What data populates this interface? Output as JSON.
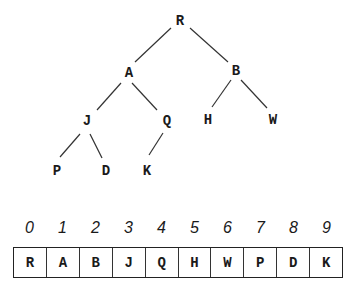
{
  "tree": {
    "nodes": [
      {
        "id": "R",
        "label": "R",
        "x": 180,
        "y": 21
      },
      {
        "id": "A",
        "label": "A",
        "x": 129,
        "y": 73
      },
      {
        "id": "B",
        "label": "B",
        "x": 236,
        "y": 71
      },
      {
        "id": "J",
        "label": "J",
        "x": 87,
        "y": 121
      },
      {
        "id": "Q",
        "label": "Q",
        "x": 167,
        "y": 121
      },
      {
        "id": "H",
        "label": "H",
        "x": 208,
        "y": 120
      },
      {
        "id": "W",
        "label": "W",
        "x": 273,
        "y": 120
      },
      {
        "id": "P",
        "label": "P",
        "x": 57,
        "y": 171
      },
      {
        "id": "D",
        "label": "D",
        "x": 106,
        "y": 171
      },
      {
        "id": "K",
        "label": "K",
        "x": 147,
        "y": 171
      }
    ],
    "edges": [
      {
        "from": "R",
        "to": "A",
        "x1": 171,
        "y1": 28,
        "x2": 135,
        "y2": 62
      },
      {
        "from": "R",
        "to": "B",
        "x1": 190,
        "y1": 28,
        "x2": 228,
        "y2": 62
      },
      {
        "from": "A",
        "to": "J",
        "x1": 121,
        "y1": 83,
        "x2": 97,
        "y2": 110
      },
      {
        "from": "A",
        "to": "Q",
        "x1": 132,
        "y1": 83,
        "x2": 157,
        "y2": 110
      },
      {
        "from": "B",
        "to": "H",
        "x1": 231,
        "y1": 80,
        "x2": 212,
        "y2": 107
      },
      {
        "from": "B",
        "to": "W",
        "x1": 241,
        "y1": 80,
        "x2": 267,
        "y2": 108
      },
      {
        "from": "J",
        "to": "P",
        "x1": 80,
        "y1": 134,
        "x2": 60,
        "y2": 157
      },
      {
        "from": "J",
        "to": "D",
        "x1": 90,
        "y1": 134,
        "x2": 102,
        "y2": 158
      },
      {
        "from": "Q",
        "to": "K",
        "x1": 163,
        "y1": 133,
        "x2": 149,
        "y2": 155
      }
    ]
  },
  "array": {
    "indices": [
      "0",
      "1",
      "2",
      "3",
      "4",
      "5",
      "6",
      "7",
      "8",
      "9"
    ],
    "values": [
      "R",
      "A",
      "B",
      "J",
      "Q",
      "H",
      "W",
      "P",
      "D",
      "K"
    ]
  }
}
